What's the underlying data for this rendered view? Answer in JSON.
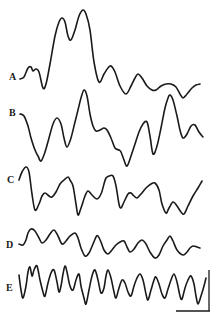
{
  "figure": {
    "type": "waveform-traces",
    "background": "#ffffff",
    "stroke_color": "#1a1a1a",
    "traces": [
      {
        "label": "A",
        "label_pos": [
          9,
          80
        ],
        "points": [
          [
            20,
            79
          ],
          [
            24,
            77
          ],
          [
            28,
            68
          ],
          [
            31,
            67
          ],
          [
            33,
            71
          ],
          [
            36,
            69
          ],
          [
            39,
            72
          ],
          [
            43,
            88
          ],
          [
            46,
            84
          ],
          [
            50,
            64
          ],
          [
            55,
            36
          ],
          [
            59,
            22
          ],
          [
            62,
            18
          ],
          [
            65,
            22
          ],
          [
            68,
            36
          ],
          [
            71,
            40
          ],
          [
            75,
            30
          ],
          [
            79,
            16
          ],
          [
            83,
            10
          ],
          [
            86,
            14
          ],
          [
            90,
            30
          ],
          [
            94,
            62
          ],
          [
            99,
            82
          ],
          [
            104,
            74
          ],
          [
            108,
            68
          ],
          [
            111,
            66
          ],
          [
            115,
            72
          ],
          [
            120,
            86
          ],
          [
            126,
            94
          ],
          [
            131,
            86
          ],
          [
            135,
            78
          ],
          [
            138,
            74
          ],
          [
            142,
            78
          ],
          [
            147,
            86
          ],
          [
            152,
            90
          ],
          [
            156,
            90
          ],
          [
            161,
            86
          ],
          [
            166,
            84
          ],
          [
            171,
            84
          ],
          [
            176,
            87
          ],
          [
            180,
            94
          ],
          [
            183,
            98
          ],
          [
            187,
            94
          ],
          [
            192,
            88
          ],
          [
            196,
            85
          ],
          [
            200,
            84
          ]
        ]
      },
      {
        "label": "B",
        "label_pos": [
          9,
          116
        ],
        "points": [
          [
            20,
            114
          ],
          [
            24,
            116
          ],
          [
            28,
            126
          ],
          [
            31,
            138
          ],
          [
            35,
            150
          ],
          [
            38,
            156
          ],
          [
            41,
            161
          ],
          [
            45,
            152
          ],
          [
            49,
            138
          ],
          [
            53,
            124
          ],
          [
            57,
            118
          ],
          [
            61,
            124
          ],
          [
            64,
            138
          ],
          [
            67,
            147
          ],
          [
            71,
            138
          ],
          [
            75,
            122
          ],
          [
            78,
            110
          ],
          [
            81,
            98
          ],
          [
            84,
            90
          ],
          [
            87,
            96
          ],
          [
            90,
            114
          ],
          [
            93,
            126
          ],
          [
            96,
            131
          ],
          [
            100,
            130
          ],
          [
            104,
            128
          ],
          [
            107,
            130
          ],
          [
            111,
            138
          ],
          [
            115,
            148
          ],
          [
            119,
            150
          ],
          [
            121,
            152
          ],
          [
            124,
            160
          ],
          [
            127,
            166
          ],
          [
            131,
            156
          ],
          [
            135,
            144
          ],
          [
            139,
            132
          ],
          [
            143,
            124
          ],
          [
            147,
            122
          ],
          [
            150,
            136
          ],
          [
            153,
            154
          ],
          [
            157,
            146
          ],
          [
            161,
            128
          ],
          [
            165,
            108
          ],
          [
            168,
            98
          ],
          [
            170,
            95
          ],
          [
            173,
            100
          ],
          [
            177,
            116
          ],
          [
            180,
            130
          ],
          [
            183,
            138
          ],
          [
            187,
            134
          ],
          [
            191,
            126
          ],
          [
            195,
            125
          ],
          [
            199,
            132
          ],
          [
            203,
            137
          ]
        ]
      },
      {
        "label": "C",
        "label_pos": [
          7,
          183
        ],
        "points": [
          [
            19,
            180
          ],
          [
            22,
            172
          ],
          [
            26,
            167
          ],
          [
            29,
            172
          ],
          [
            32,
            194
          ],
          [
            35,
            210
          ],
          [
            39,
            204
          ],
          [
            42,
            196
          ],
          [
            45,
            193
          ],
          [
            49,
            196
          ],
          [
            52,
            197
          ],
          [
            56,
            192
          ],
          [
            60,
            184
          ],
          [
            64,
            180
          ],
          [
            68,
            177
          ],
          [
            70,
            180
          ],
          [
            73,
            186
          ],
          [
            76,
            204
          ],
          [
            78,
            215
          ],
          [
            81,
            208
          ],
          [
            85,
            196
          ],
          [
            88,
            191
          ],
          [
            92,
            195
          ],
          [
            97,
            199
          ],
          [
            101,
            194
          ],
          [
            104,
            184
          ],
          [
            106,
            178
          ],
          [
            109,
            176
          ],
          [
            113,
            176
          ],
          [
            116,
            186
          ],
          [
            119,
            204
          ],
          [
            121,
            208
          ],
          [
            124,
            202
          ],
          [
            128,
            194
          ],
          [
            131,
            193
          ],
          [
            134,
            196
          ],
          [
            137,
            198
          ],
          [
            141,
            194
          ],
          [
            146,
            188
          ],
          [
            151,
            184
          ],
          [
            155,
            183
          ],
          [
            159,
            190
          ],
          [
            162,
            204
          ],
          [
            166,
            213
          ],
          [
            169,
            208
          ],
          [
            173,
            202
          ],
          [
            177,
            206
          ],
          [
            181,
            212
          ],
          [
            184,
            214
          ],
          [
            188,
            206
          ],
          [
            193,
            196
          ],
          [
            198,
            188
          ],
          [
            202,
            181
          ]
        ]
      },
      {
        "label": "D",
        "label_pos": [
          6,
          248
        ],
        "points": [
          [
            19,
            244
          ],
          [
            23,
            245
          ],
          [
            26,
            240
          ],
          [
            28,
            233
          ],
          [
            31,
            229
          ],
          [
            35,
            231
          ],
          [
            39,
            238
          ],
          [
            42,
            243
          ],
          [
            46,
            240
          ],
          [
            50,
            234
          ],
          [
            54,
            230
          ],
          [
            58,
            236
          ],
          [
            62,
            244
          ],
          [
            66,
            241
          ],
          [
            70,
            236
          ],
          [
            75,
            233
          ],
          [
            78,
            238
          ],
          [
            81,
            248
          ],
          [
            85,
            256
          ],
          [
            89,
            253
          ],
          [
            93,
            244
          ],
          [
            96,
            237
          ],
          [
            98,
            236
          ],
          [
            101,
            242
          ],
          [
            104,
            250
          ],
          [
            108,
            254
          ],
          [
            112,
            250
          ],
          [
            116,
            245
          ],
          [
            120,
            242
          ],
          [
            124,
            241
          ],
          [
            127,
            247
          ],
          [
            130,
            252
          ],
          [
            134,
            249
          ],
          [
            138,
            243
          ],
          [
            142,
            240
          ],
          [
            146,
            244
          ],
          [
            150,
            252
          ],
          [
            155,
            258
          ],
          [
            159,
            255
          ],
          [
            163,
            246
          ],
          [
            167,
            240
          ],
          [
            170,
            236
          ],
          [
            173,
            241
          ],
          [
            177,
            250
          ],
          [
            183,
            255
          ],
          [
            187,
            252
          ],
          [
            190,
            248
          ],
          [
            193,
            246
          ],
          [
            197,
            247
          ],
          [
            200,
            248
          ]
        ]
      },
      {
        "label": "E",
        "label_pos": [
          6,
          291
        ],
        "points": [
          [
            19,
            275
          ],
          [
            21,
            290
          ],
          [
            23,
            298
          ],
          [
            26,
            286
          ],
          [
            28,
            272
          ],
          [
            30,
            267
          ],
          [
            32,
            276
          ],
          [
            34,
            270
          ],
          [
            37,
            266
          ],
          [
            40,
            280
          ],
          [
            43,
            292
          ],
          [
            45,
            296
          ],
          [
            48,
            283
          ],
          [
            51,
            273
          ],
          [
            54,
            270
          ],
          [
            57,
            282
          ],
          [
            59,
            292
          ],
          [
            61,
            286
          ],
          [
            63,
            274
          ],
          [
            65,
            266
          ],
          [
            67,
            272
          ],
          [
            70,
            286
          ],
          [
            73,
            290
          ],
          [
            76,
            280
          ],
          [
            79,
            274
          ],
          [
            81,
            286
          ],
          [
            84,
            298
          ],
          [
            86,
            304
          ],
          [
            89,
            290
          ],
          [
            92,
            276
          ],
          [
            95,
            270
          ],
          [
            98,
            280
          ],
          [
            101,
            293
          ],
          [
            104,
            288
          ],
          [
            106,
            276
          ],
          [
            108,
            270
          ],
          [
            111,
            278
          ],
          [
            114,
            292
          ],
          [
            116,
            298
          ],
          [
            119,
            288
          ],
          [
            122,
            280
          ],
          [
            125,
            283
          ],
          [
            128,
            292
          ],
          [
            131,
            296
          ],
          [
            134,
            286
          ],
          [
            137,
            278
          ],
          [
            140,
            274
          ],
          [
            143,
            280
          ],
          [
            146,
            294
          ],
          [
            148,
            300
          ],
          [
            151,
            290
          ],
          [
            154,
            280
          ],
          [
            156,
            277
          ],
          [
            159,
            284
          ],
          [
            162,
            294
          ],
          [
            165,
            298
          ],
          [
            168,
            289
          ],
          [
            171,
            280
          ],
          [
            174,
            274
          ],
          [
            177,
            282
          ],
          [
            180,
            296
          ],
          [
            182,
            299
          ],
          [
            185,
            288
          ],
          [
            188,
            280
          ],
          [
            191,
            276
          ],
          [
            194,
            284
          ],
          [
            196,
            296
          ],
          [
            198,
            304
          ],
          [
            201,
            296
          ],
          [
            204,
            286
          ],
          [
            206,
            278
          ]
        ]
      }
    ],
    "scale_bar": {
      "vertical": [
        [
          209,
          270
        ],
        [
          209,
          311
        ]
      ],
      "horizontal": [
        [
          176,
          311
        ],
        [
          210,
          311
        ]
      ]
    }
  }
}
